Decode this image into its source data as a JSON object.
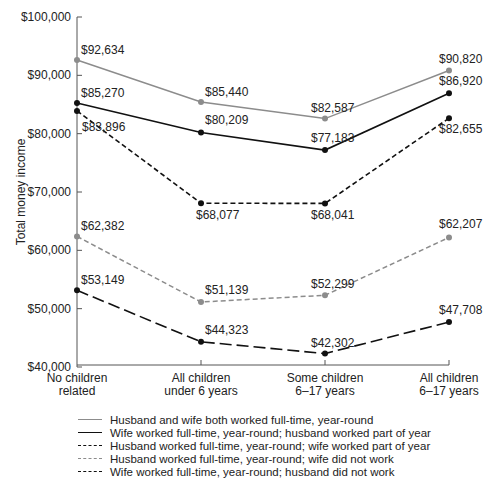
{
  "chart_data": {
    "type": "line",
    "title": "",
    "xlabel": "",
    "ylabel": "Total money income",
    "ylim": [
      40000,
      100000
    ],
    "yticks": [
      "$40,000",
      "$50,000",
      "$60,000",
      "$70,000",
      "$80,000",
      "$90,000",
      "$100,000"
    ],
    "grid": false,
    "legend_position": "bottom",
    "categories": [
      [
        "No children",
        "related"
      ],
      [
        "All children",
        "under 6 years"
      ],
      [
        "Some children",
        "6–17 years"
      ],
      [
        "All children",
        "6–17 years"
      ]
    ],
    "series": [
      {
        "name": "Husband and wife both worked full-time, year-round",
        "values": [
          92634,
          85440,
          82587,
          90820
        ],
        "labels": [
          "$92,634",
          "$85,440",
          "$82,587",
          "$90,820"
        ],
        "color": "#8c8c8c",
        "style": "solid"
      },
      {
        "name": "Wife worked full-time, year-round; husband worked part of year",
        "values": [
          85270,
          80209,
          77183,
          86920
        ],
        "labels": [
          "$85,270",
          "$80,209",
          "$77,183",
          "$86,920"
        ],
        "color": "#111111",
        "style": "solid"
      },
      {
        "name": "Husband worked full-time, year-round; wife worked part of year",
        "values": [
          83896,
          68077,
          68041,
          82655
        ],
        "labels": [
          "$83,896",
          "$68,077",
          "$68,041",
          "$82,655"
        ],
        "color": "#111111",
        "style": "dashed"
      },
      {
        "name": "Husband worked full-time, year-round; wife did not work",
        "values": [
          62382,
          51139,
          52299,
          62207
        ],
        "labels": [
          "$62,382",
          "$51,139",
          "$52,299",
          "$62,207"
        ],
        "color": "#8c8c8c",
        "style": "dashed"
      },
      {
        "name": "Wife worked full-time, year-round; husband did not work",
        "values": [
          53149,
          44323,
          42302,
          47708
        ],
        "labels": [
          "$53,149",
          "$44,323",
          "$42,302",
          "$47,708"
        ],
        "color": "#111111",
        "style": "long-dashed"
      }
    ]
  }
}
